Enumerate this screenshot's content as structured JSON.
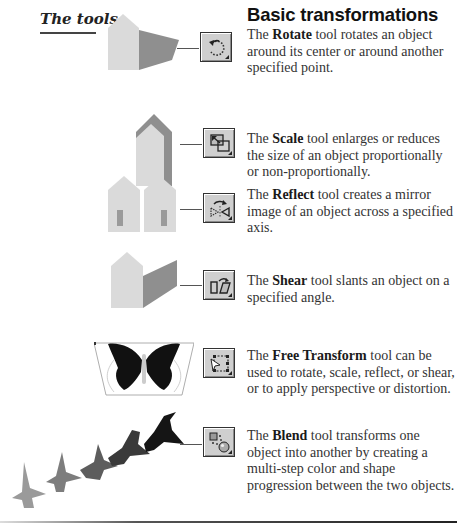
{
  "sidebar": {
    "title": "The tools"
  },
  "section": {
    "heading": "Basic transformations"
  },
  "tools": [
    {
      "name": "Rotate",
      "icon": "rotate-tool-icon",
      "before": "The ",
      "after": " tool rotates an object around its center or around another specified point."
    },
    {
      "name": "Scale",
      "icon": "scale-tool-icon",
      "before": "The ",
      "after": " tool enlarges or reduces the size of an object proportionally or non-proportionally."
    },
    {
      "name": "Reflect",
      "icon": "reflect-tool-icon",
      "before": "The ",
      "after": " tool creates a mirror image of an object across a specified axis."
    },
    {
      "name": "Shear",
      "icon": "shear-tool-icon",
      "before": "The ",
      "after": " tool slants an object on a specified angle."
    },
    {
      "name": "Free Transform",
      "icon": "free-transform-tool-icon",
      "before": "The ",
      "after": " tool can be used to rotate, scale, reflect, or shear, or to apply perspective or distortion."
    },
    {
      "name": "Blend",
      "icon": "blend-tool-icon",
      "before": "The ",
      "after": " tool transforms one object into another by creating a multi-step color and shape progression between the two objects."
    }
  ],
  "colors": {
    "light_shape": "#d9d9d9",
    "dark_shape": "#8c8c8c",
    "mid_shape": "#a8a8a8",
    "button_face": "#cfcfcf"
  }
}
